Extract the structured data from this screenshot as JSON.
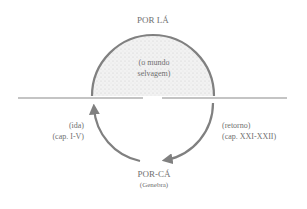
{
  "diagram": {
    "top_label": "POR LÁ",
    "inner_label_line1": "(o mundo",
    "inner_label_line2": "selvagem)",
    "left_label_line1": "(ida)",
    "left_label_line2": "(cap. I-V)",
    "right_label_line1": "(retorno)",
    "right_label_line2": "(cap. XXI-XXII)",
    "bottom_label": "POR-CÁ",
    "bottom_sublabel": "(Genebra)",
    "colors": {
      "stroke": "#808080",
      "fill_stipple": "#e6e6e6",
      "text": "#6f6f6f"
    }
  }
}
